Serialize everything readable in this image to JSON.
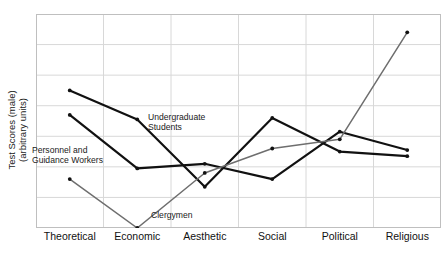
{
  "chart_data": {
    "type": "line",
    "title": "",
    "xlabel": "",
    "ylabel": "Test Scores (male) (arbitrary units)",
    "ylabel_line1": "Test Scores (male)",
    "ylabel_line2": "(arbitrary units)",
    "categories": [
      "Theoretical",
      "Economic",
      "Aesthetic",
      "Social",
      "Political",
      "Religious"
    ],
    "ylim": [
      0,
      7
    ],
    "grid": true,
    "grid_rows": 7,
    "legend_position": "inline-annotations",
    "series": [
      {
        "name": "Undergraduate Students",
        "color": "#111111",
        "width": 2.2,
        "values": [
          4.5,
          3.55,
          1.35,
          3.6,
          2.5,
          2.35
        ]
      },
      {
        "name": "Personnel and Guidance Workers",
        "color": "#111111",
        "width": 2.2,
        "values": [
          3.7,
          1.95,
          2.1,
          1.6,
          3.15,
          2.55
        ]
      },
      {
        "name": "Clergymen",
        "color": "#6e6e6e",
        "width": 1.5,
        "values": [
          1.6,
          0.0,
          1.8,
          2.6,
          2.9,
          6.4
        ]
      }
    ],
    "annotations": [
      {
        "id": "undergraduate",
        "line1": "Undergraduate",
        "line2": "Students"
      },
      {
        "id": "personnel",
        "line1": "Personnel and",
        "line2": "Guidance Workers"
      },
      {
        "id": "clergymen",
        "line1": "Clergymen",
        "line2": ""
      }
    ],
    "colors": {
      "grid": "#d8d8d8",
      "frame": "#bfbfbf",
      "axis_text": "#111111",
      "dark_series": "#111111",
      "light_series": "#6e6e6e"
    }
  }
}
